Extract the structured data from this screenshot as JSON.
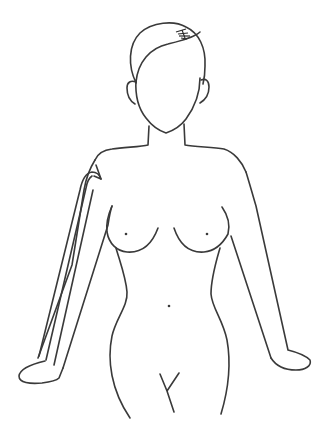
{
  "diagram": {
    "type": "body-outline-illustration",
    "description": "Front-view female body outline with an arrow traced along the right arm (viewer's left) pointing toward the armpit",
    "colors": {
      "background": "#ffffff",
      "line": "#3a3a3a",
      "hair_shading": "#2a2a2a",
      "arrow": "#3a3a3a"
    },
    "stroke_width": 1.6,
    "arrow": {
      "direction": "upward-toward-armpit",
      "parallel_lines": 3
    },
    "markers": [
      {
        "name": "left-nipple",
        "x": 126,
        "y": 234
      },
      {
        "name": "right-nipple",
        "x": 207,
        "y": 234
      },
      {
        "name": "navel",
        "x": 169,
        "y": 306
      }
    ]
  }
}
